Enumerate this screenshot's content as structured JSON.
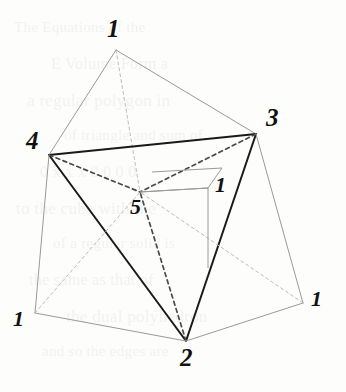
{
  "figure": {
    "width": 346,
    "height": 392,
    "background_color": "#fdfdfc",
    "ink_color": "#3a3a3a",
    "bold_ink_color": "#1a1a1a",
    "light_ink_color": "#9a9a9a",
    "dashed_ink_color": "#4a4a4a",
    "faint_dashed_color": "#bcbcbc"
  },
  "vertices": [
    {
      "id": "apex",
      "label": "1",
      "x": 116,
      "y": 50,
      "label_x": 107,
      "label_y": 16,
      "font_size": 25
    },
    {
      "id": "right",
      "label": "3",
      "x": 256,
      "y": 134,
      "label_x": 266,
      "label_y": 105,
      "font_size": 25
    },
    {
      "id": "left",
      "label": "4",
      "x": 49,
      "y": 155,
      "label_x": 26,
      "label_y": 128,
      "font_size": 25
    },
    {
      "id": "bottom",
      "label": "2",
      "x": 186,
      "y": 341,
      "label_x": 180,
      "label_y": 345,
      "font_size": 25
    },
    {
      "id": "center",
      "label": "5",
      "x": 140,
      "y": 192,
      "label_x": 130,
      "label_y": 196,
      "font_size": 22
    },
    {
      "id": "inner-cube",
      "label": "1",
      "x": 208,
      "y": 188,
      "label_x": 215,
      "label_y": 174,
      "font_size": 22
    },
    {
      "id": "bottom-left",
      "label": "1",
      "x": 35,
      "y": 313,
      "label_x": 13,
      "label_y": 308,
      "font_size": 22
    },
    {
      "id": "bottom-right",
      "label": "1",
      "x": 303,
      "y": 303,
      "label_x": 311,
      "label_y": 288,
      "font_size": 22
    }
  ],
  "edges": [
    {
      "id": "apex-to-4",
      "from": "apex",
      "to": "left",
      "style": "solid",
      "weight": "light"
    },
    {
      "id": "apex-to-3",
      "from": "apex",
      "to": "right",
      "style": "solid",
      "weight": "light"
    },
    {
      "id": "apex-to-5",
      "from": "apex",
      "to": "center",
      "style": "dashed",
      "weight": "faint"
    },
    {
      "id": "edge-4-3",
      "from": "left",
      "to": "right",
      "style": "solid",
      "weight": "bold"
    },
    {
      "id": "edge-4-2",
      "from": "left",
      "to": "bottom",
      "style": "solid",
      "weight": "bold"
    },
    {
      "id": "edge-3-2",
      "from": "right",
      "to": "bottom",
      "style": "solid",
      "weight": "bold"
    },
    {
      "id": "edge-4-5",
      "from": "left",
      "to": "center",
      "style": "dashed",
      "weight": "heavy"
    },
    {
      "id": "edge-3-5",
      "from": "right",
      "to": "center",
      "style": "dashed",
      "weight": "heavy"
    },
    {
      "id": "edge-2-5",
      "from": "bottom",
      "to": "center",
      "style": "dashed",
      "weight": "heavy"
    },
    {
      "id": "edge-4-bl",
      "from": "left",
      "to": "bottom-left",
      "style": "solid",
      "weight": "light"
    },
    {
      "id": "edge-3-br",
      "from": "right",
      "to": "bottom-right",
      "style": "solid",
      "weight": "light"
    },
    {
      "id": "edge-bl-2",
      "from": "bottom-left",
      "to": "bottom",
      "style": "solid",
      "weight": "light"
    },
    {
      "id": "edge-2-br",
      "from": "bottom",
      "to": "bottom-right",
      "style": "solid",
      "weight": "light"
    },
    {
      "id": "diag-bl-5",
      "from": "bottom-left",
      "to": "center",
      "style": "dashed",
      "weight": "faint"
    },
    {
      "id": "diag-br-5",
      "from": "bottom-right",
      "to": "center",
      "style": "dashed",
      "weight": "faint"
    },
    {
      "id": "inner-5-cube",
      "from": "center",
      "to": "inner-cube",
      "style": "solid",
      "weight": "light"
    }
  ],
  "inner_cube": {
    "id": "inner-cube-outline",
    "points": "140,192 208,188 222,168 152,172",
    "vertical_from": "208,188",
    "vertical_to": "208,268"
  },
  "ghost_text": {
    "lines": [
      "The Equations of the",
      "E Volume Form a",
      "a regular polygon in",
      "of triangle and sum of",
      "0 x x x 0 0 0 0",
      "to the cube with the",
      "of a regular solid is",
      "the same as that of",
      "the dual polyhedron",
      "and so the edges are"
    ]
  }
}
